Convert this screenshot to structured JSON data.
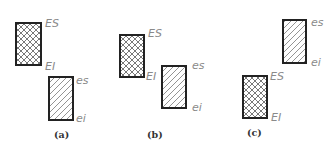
{
  "figure": {
    "panels": [
      {
        "id": "a",
        "caption": "(a)",
        "hole": {
          "hatch": "crosshatch",
          "upper_label": "ES",
          "lower_label": "EI"
        },
        "shaft": {
          "hatch": "diagonal",
          "upper_label": "es",
          "lower_label": "ei"
        },
        "arrangement": "hole above shaft (clearance)"
      },
      {
        "id": "b",
        "caption": "(b)",
        "hole": {
          "hatch": "crosshatch",
          "upper_label": "ES",
          "lower_label": "EI"
        },
        "shaft": {
          "hatch": "diagonal",
          "upper_label": "es",
          "lower_label": "ei"
        },
        "arrangement": "hole and shaft overlap (transition)"
      },
      {
        "id": "c",
        "caption": "(c)",
        "hole": {
          "hatch": "crosshatch",
          "upper_label": "ES",
          "lower_label": "EI"
        },
        "shaft": {
          "hatch": "diagonal",
          "upper_label": "es",
          "lower_label": "ei"
        },
        "arrangement": "shaft above hole (interference)"
      }
    ],
    "colors": {
      "outline": "#222222",
      "label": "#8a8a8a",
      "hatch": "#555555"
    }
  }
}
